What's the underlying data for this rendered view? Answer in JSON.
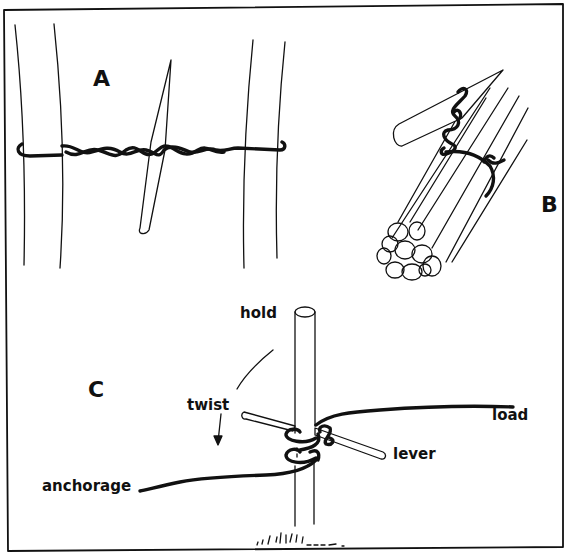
{
  "figure": {
    "panels": [
      {
        "id": "A",
        "label": "A",
        "description": "Twisted wire binding between two poles, tightened with a spike"
      },
      {
        "id": "B",
        "label": "B",
        "description": "Bundle of rods bound with wire twisted around a spike"
      },
      {
        "id": "C",
        "label": "C",
        "description": "Post with wire wrapped and a lever used to twist"
      }
    ],
    "annotations": {
      "hold": "hold",
      "twist": "twist",
      "load": "load",
      "lever": "lever",
      "anchorage": "anchorage"
    },
    "colors": {
      "ink": "#111111",
      "paper": "#ffffff"
    }
  }
}
